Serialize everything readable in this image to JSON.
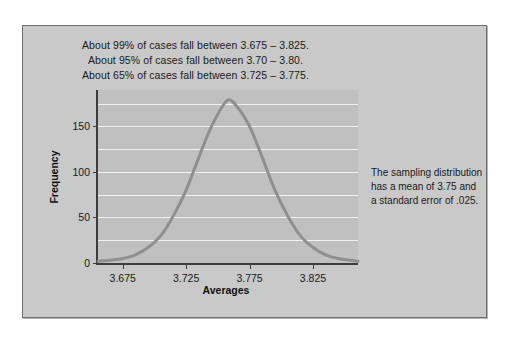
{
  "figure": {
    "background_color": "#c9c9c9",
    "plot_background_color": "#c0c0c0",
    "gridline_color": "#f2f2f2",
    "axis_color": "#3c3c3c",
    "curve_color": "#8f8f8f"
  },
  "annotations": {
    "line1": "About 99% of cases fall between 3.675 – 3.825.",
    "line2": "About 95% of cases fall between 3.70 – 3.80.",
    "line3": "About 65% of cases fall between 3.725 – 3.775."
  },
  "side_note": {
    "line1": "The sampling distribution",
    "line2": "has a mean of 3.75 and",
    "line3": "a standard error of .025."
  },
  "chart_data": {
    "type": "line",
    "title": "",
    "xlabel": "Averages",
    "ylabel": "Frequency",
    "xlim": [
      3.6555,
      3.8605
    ],
    "ylim": [
      0,
      190
    ],
    "xticks": [
      "3.675",
      "3.725",
      "3.775",
      "3.825"
    ],
    "xtick_values": [
      3.675,
      3.725,
      3.775,
      3.825
    ],
    "yticks": [
      "0",
      "50",
      "100",
      "150"
    ],
    "ytick_values": [
      0,
      50,
      100,
      150
    ],
    "gridlines": [
      25,
      50,
      75,
      100,
      125,
      150,
      175
    ],
    "grid": true,
    "legend": "none",
    "distribution": {
      "shape": "normal",
      "mean": 3.757,
      "standard_error": 0.025,
      "peak_frequency": 178
    },
    "x": [
      3.6555,
      3.665,
      3.675,
      3.685,
      3.695,
      3.705,
      3.715,
      3.725,
      3.735,
      3.745,
      3.757,
      3.765,
      3.775,
      3.785,
      3.795,
      3.805,
      3.815,
      3.825,
      3.835,
      3.845,
      3.8605
    ],
    "values": [
      2,
      3,
      5,
      9,
      17,
      30,
      52,
      80,
      116,
      150,
      178,
      172,
      150,
      116,
      80,
      52,
      30,
      17,
      9,
      5,
      2
    ]
  }
}
